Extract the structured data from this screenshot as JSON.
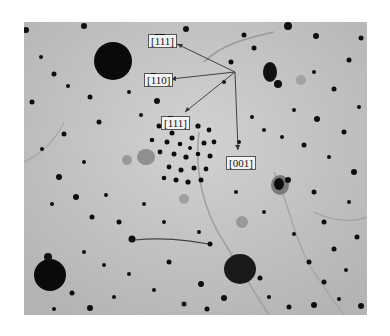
{
  "figure": {
    "type": "micrograph",
    "background_color": "#bdbdbd",
    "labels": [
      {
        "id": "l1",
        "parts": [
          {
            "t": "[",
            "o": false
          },
          {
            "t": "1",
            "o": true
          },
          {
            "t": "1",
            "o": true
          },
          {
            "t": "1]",
            "o": false
          }
        ],
        "text": "[1̄1̄1]",
        "x": 148,
        "y": 33,
        "arrow_to": [
          235,
          72
        ]
      },
      {
        "id": "l2",
        "parts": [
          {
            "t": "[",
            "o": false
          },
          {
            "t": "1",
            "o": true
          },
          {
            "t": "10]",
            "o": false
          }
        ],
        "text": "[1̄10]",
        "x": 144,
        "y": 72,
        "arrow_to": [
          235,
          72
        ]
      },
      {
        "id": "l3",
        "parts": [
          {
            "t": "[",
            "o": false
          },
          {
            "t": "1",
            "o": true
          },
          {
            "t": "11]",
            "o": false
          }
        ],
        "text": "[1̄11]",
        "x": 161,
        "y": 116,
        "arrow_to": [
          235,
          72
        ]
      },
      {
        "id": "l4",
        "parts": [
          {
            "t": "[001]",
            "o": false
          }
        ],
        "text": "[001]",
        "x": 226,
        "y": 156,
        "arrow_to": [
          235,
          72
        ]
      }
    ],
    "arrow_origin": [
      235,
      72
    ]
  }
}
